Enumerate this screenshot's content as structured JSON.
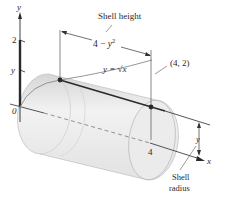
{
  "figure": {
    "type": "shell-method-diagram",
    "labels": {
      "y_axis": "y",
      "x_axis": "x",
      "tick_2": "2",
      "tick_y": "y",
      "origin": "0",
      "tick_4": "4",
      "shell_height": "Shell height",
      "height_expr": "4 − y²",
      "curve_eq": "y = √x",
      "point": "(4, 2)",
      "radius_dim": "y",
      "shell_radius_line1": "Shell",
      "shell_radius_line2": "radius"
    },
    "colors": {
      "axis": "#2a2a2a",
      "cylinder_fill": "#e4e4e4",
      "cylinder_edge": "#b8b8b8",
      "curve": "#8a8a8a",
      "point": "#2a2a2a"
    }
  }
}
